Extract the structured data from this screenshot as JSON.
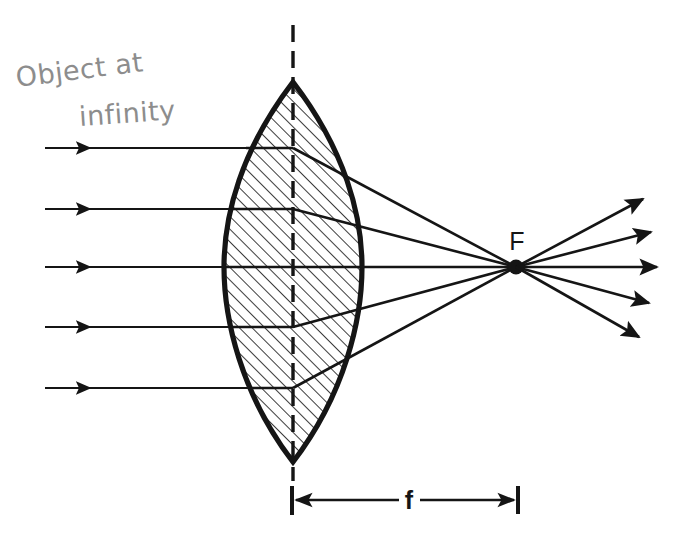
{
  "figure": {
    "background_color": "#ffffff",
    "ink_color": "#151515",
    "pencil_color": "#8d8d8d",
    "width": 694,
    "height": 545
  },
  "annotations": {
    "object_note_line1": "Object at",
    "object_note_line2": "infinity",
    "focal_point_label": "F",
    "focal_length_label": "f"
  },
  "diagram_data": {
    "type": "ray-diagram",
    "optical_element": "biconvex converging lens",
    "axis": {
      "style": "dashed",
      "x": 293,
      "y_top": 25,
      "y_bottom": 481
    },
    "lens": {
      "center_x": 293,
      "apex_top_y": 82,
      "apex_bottom_y": 462,
      "half_width": 68,
      "hatched": true,
      "hatch_angle_deg": 45
    },
    "focal_point": {
      "x": 516,
      "y": 267
    },
    "focal_length_dimension": {
      "y": 500,
      "x_start": 292,
      "x_end": 518,
      "tick_half_height": 14
    },
    "incoming_rays": [
      {
        "y": 148,
        "x_start": 45,
        "x_lens_entry": 246
      },
      {
        "y": 209,
        "x_start": 45,
        "x_lens_entry": 232
      },
      {
        "y": 267,
        "x_start": 45,
        "x_lens_entry": 226
      },
      {
        "y": 327,
        "x_start": 45,
        "x_lens_entry": 233
      },
      {
        "y": 388,
        "x_start": 45,
        "x_lens_entry": 249
      }
    ],
    "exit_points": [
      {
        "x": 341,
        "y": 148
      },
      {
        "x": 355,
        "y": 209
      },
      {
        "x": 361,
        "y": 267
      },
      {
        "x": 354,
        "y": 327
      },
      {
        "x": 338,
        "y": 388
      }
    ],
    "diverging_rays": [
      {
        "x_end": 643,
        "y_end": 199
      },
      {
        "x_end": 651,
        "y_end": 232
      },
      {
        "x_end": 657,
        "y_end": 267
      },
      {
        "x_end": 649,
        "y_end": 303
      },
      {
        "x_end": 639,
        "y_end": 337
      }
    ]
  }
}
